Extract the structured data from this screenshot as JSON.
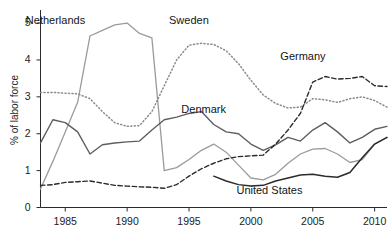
{
  "chart_data": {
    "type": "line",
    "title": "",
    "subtitle": "",
    "xlabel": "",
    "ylabel": "% of labor force",
    "xlim": [
      1983,
      2011
    ],
    "ylim": [
      0,
      5.3
    ],
    "xticks": [
      1985,
      1990,
      1995,
      2000,
      2005,
      2010
    ],
    "xtick_labels": [
      "1985",
      "1990",
      "1995",
      "2000",
      "2005",
      "2010"
    ],
    "yticks": [
      0,
      1,
      2,
      3,
      4,
      5
    ],
    "ytick_labels": [
      "0",
      "1",
      "2",
      "3",
      "4",
      "5"
    ],
    "grid": false,
    "legend_position": "inline-annotations",
    "x": [
      1983,
      1984,
      1985,
      1986,
      1987,
      1988,
      1989,
      1990,
      1991,
      1992,
      1993,
      1994,
      1995,
      1996,
      1997,
      1998,
      1999,
      2000,
      2001,
      2002,
      2003,
      2004,
      2005,
      2006,
      2007,
      2008,
      2009,
      2010,
      2011
    ],
    "series": [
      {
        "name": "Netherlands",
        "style": "solid",
        "color": "#9b9b9b",
        "width": 1.3,
        "label_x": 1984.2,
        "label_y": 5.02,
        "values": [
          0.5,
          1.25,
          2.05,
          2.85,
          4.65,
          4.8,
          4.95,
          5.0,
          4.72,
          4.6,
          1.0,
          1.08,
          1.3,
          1.55,
          1.72,
          1.5,
          1.15,
          0.8,
          0.75,
          0.9,
          1.2,
          1.45,
          1.58,
          1.6,
          1.45,
          1.22,
          1.3,
          1.72,
          1.9
        ]
      },
      {
        "name": "Sweden",
        "style": "dotted",
        "color": "#8a8a8a",
        "width": 1.5,
        "label_x": 1995.0,
        "label_y": 5.02,
        "values": [
          3.12,
          3.12,
          3.1,
          3.08,
          2.95,
          2.6,
          2.3,
          2.2,
          2.22,
          2.6,
          3.3,
          4.0,
          4.4,
          4.45,
          4.42,
          4.25,
          3.9,
          3.45,
          3.05,
          2.82,
          2.7,
          2.72,
          2.95,
          2.92,
          2.85,
          2.95,
          3.0,
          2.9,
          2.72
        ]
      },
      {
        "name": "Denmark",
        "style": "solid",
        "color": "#5e5e5e",
        "width": 1.4,
        "label_x": 1996.2,
        "label_y": 2.62,
        "values": [
          1.75,
          2.38,
          2.3,
          2.05,
          1.45,
          1.7,
          1.75,
          1.78,
          1.8,
          2.1,
          2.38,
          2.45,
          2.55,
          2.6,
          2.25,
          2.05,
          2.0,
          1.72,
          1.55,
          1.7,
          1.9,
          1.8,
          2.1,
          2.3,
          2.05,
          1.75,
          1.9,
          2.12,
          2.2
        ]
      },
      {
        "name": "Germany",
        "style": "dashed",
        "color": "#2b2b2b",
        "width": 1.4,
        "label_x": 2004.2,
        "label_y": 4.05,
        "values": [
          0.6,
          0.62,
          0.68,
          0.7,
          0.72,
          0.66,
          0.6,
          0.58,
          0.56,
          0.55,
          0.52,
          0.62,
          0.85,
          1.05,
          1.2,
          1.32,
          1.38,
          1.4,
          1.42,
          1.72,
          2.1,
          2.55,
          3.4,
          3.55,
          3.48,
          3.5,
          3.55,
          3.3,
          3.28
        ]
      },
      {
        "name": "United States",
        "style": "solid",
        "color": "#2b2b2b",
        "width": 1.5,
        "label_x": 2001.5,
        "label_y": 0.42,
        "values": [
          null,
          null,
          null,
          null,
          null,
          null,
          null,
          null,
          null,
          null,
          null,
          null,
          null,
          null,
          0.85,
          0.72,
          0.62,
          0.58,
          0.6,
          0.72,
          0.8,
          0.88,
          0.9,
          0.85,
          0.82,
          0.95,
          1.35,
          1.72,
          1.9
        ]
      }
    ]
  }
}
